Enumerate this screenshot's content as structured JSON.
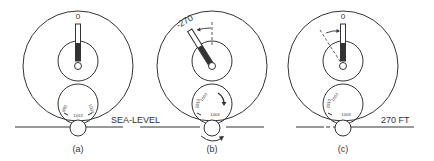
{
  "figure": {
    "panels": [
      {
        "id": "a",
        "caption": "(a)",
        "needle_zero_label": "0",
        "subscale_labels": [
          "993",
          "1013",
          "1003"
        ],
        "ground_label": "SEA-LEVEL"
      },
      {
        "id": "b",
        "caption": "(b)",
        "needle_reading_label": "-270",
        "subscale_labels": [
          "1013",
          "1003",
          "1003"
        ]
      },
      {
        "id": "c",
        "caption": "(c)",
        "needle_zero_label": "0",
        "subscale_labels": [
          "1013",
          "1003",
          "1003"
        ],
        "ground_label": "270 FT"
      }
    ]
  }
}
